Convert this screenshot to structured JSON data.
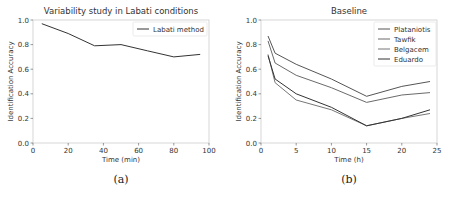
{
  "chart_data": [
    {
      "type": "line",
      "title": "Variability study in Labati conditions",
      "xlabel": "Time (min)",
      "ylabel": "Identification Accuracy",
      "xlim": [
        0,
        100
      ],
      "ylim": [
        0.0,
        1.0
      ],
      "xticks": [
        "0",
        "20",
        "40",
        "60",
        "80",
        "100"
      ],
      "yticks": [
        "0.0",
        "0.2",
        "0.4",
        "0.6",
        "0.8",
        "1.0"
      ],
      "legend_position": "upper right",
      "grid": false,
      "caption": "(a)",
      "series": [
        {
          "name": "Labati method",
          "color": "#333333",
          "x": [
            5,
            20,
            35,
            50,
            65,
            80,
            95
          ],
          "values": [
            0.97,
            0.89,
            0.79,
            0.8,
            0.75,
            0.7,
            0.72
          ]
        }
      ]
    },
    {
      "type": "line",
      "title": "Baseline",
      "xlabel": "Time (h)",
      "ylabel": "Identification Accuracy",
      "xlim": [
        0,
        25
      ],
      "ylim": [
        0.0,
        1.0
      ],
      "xticks": [
        "0",
        "5",
        "10",
        "15",
        "20",
        "25"
      ],
      "yticks": [
        "0.0",
        "0.2",
        "0.4",
        "0.6",
        "0.8",
        "1.0"
      ],
      "legend_position": "upper right",
      "grid": false,
      "caption": "(b)",
      "series": [
        {
          "name": "Plataniotis",
          "color": "#555555",
          "x": [
            1,
            2,
            5,
            10,
            15,
            20,
            24
          ],
          "values": [
            0.87,
            0.73,
            0.64,
            0.52,
            0.38,
            0.46,
            0.5
          ]
        },
        {
          "name": "Tawfik",
          "color": "#6a6a6a",
          "x": [
            1,
            2,
            5,
            10,
            15,
            20,
            24
          ],
          "values": [
            0.83,
            0.65,
            0.55,
            0.45,
            0.33,
            0.39,
            0.41
          ]
        },
        {
          "name": "Belgacem",
          "color": "#777777",
          "x": [
            1,
            2,
            5,
            10,
            15,
            20,
            24
          ],
          "values": [
            0.72,
            0.49,
            0.35,
            0.27,
            0.14,
            0.2,
            0.24
          ]
        },
        {
          "name": "Eduardo",
          "color": "#333333",
          "x": [
            1,
            2,
            5,
            10,
            15,
            20,
            24
          ],
          "values": [
            0.71,
            0.52,
            0.4,
            0.29,
            0.14,
            0.2,
            0.27
          ]
        }
      ]
    }
  ]
}
